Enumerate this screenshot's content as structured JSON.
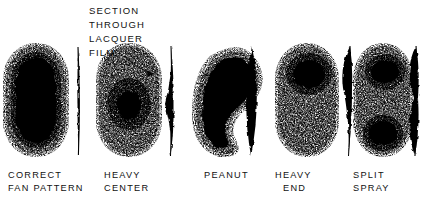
{
  "figure": {
    "background_color": "#ffffff",
    "ink_color": "#000000",
    "callout": {
      "lines": [
        "SECTION",
        "THROUGH",
        "LACQUER",
        "FILM"
      ],
      "arrow_target": "cross-section-1"
    },
    "patterns": [
      {
        "id": "correct-fan-pattern",
        "label_lines": [
          "CORRECT",
          "FAN PATTERN"
        ],
        "face_shape": "elongated-oval",
        "core": "full-length-dense-core",
        "section_shape": "thin-uniform-sliver",
        "section_description": "even thin film, uniform thickness"
      },
      {
        "id": "heavy-center",
        "label_lines": [
          "HEAVY",
          "CENTER"
        ],
        "face_shape": "elongated-oval",
        "core": "small-dense-blob-at-center",
        "section_shape": "center-bulge",
        "section_description": "film thickest at the middle"
      },
      {
        "id": "peanut",
        "label_lines": [
          "PEANUT"
        ],
        "face_shape": "crescent-kidney",
        "core": "curved-c-shaped-dense-mass",
        "section_shape": "symmetric-lens",
        "section_description": "lens shaped, thick through the middle"
      },
      {
        "id": "heavy-end",
        "label_lines": [
          "HEAVY",
          "END"
        ],
        "face_shape": "elongated-oval",
        "core": "dense-blob-at-top-end",
        "section_shape": "top-bulge",
        "section_description": "film thickest near the upper end"
      },
      {
        "id": "split-spray",
        "label_lines": [
          "SPLIT",
          "SPRAY"
        ],
        "face_shape": "elongated-oval",
        "core": "two-dense-blobs-top-and-bottom",
        "section_shape": "hourglass",
        "section_description": "thick at both ends, pinched at center"
      }
    ]
  }
}
